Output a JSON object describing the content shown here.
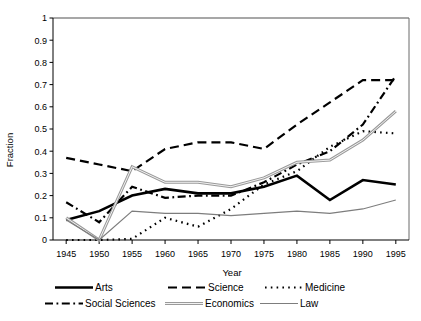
{
  "chart_data": {
    "type": "line",
    "title": "",
    "xlabel": "Year",
    "ylabel": "Fraction",
    "xlim": [
      1943,
      1997
    ],
    "ylim": [
      0,
      1
    ],
    "grid": false,
    "legend_position": "bottom",
    "x": [
      1945,
      1950,
      1955,
      1960,
      1965,
      1970,
      1975,
      1980,
      1985,
      1990,
      1995
    ],
    "xtick_labels": [
      "1945",
      "1950",
      "1955",
      "1960",
      "1965",
      "1970",
      "1975",
      "1980",
      "1985",
      "1990",
      "1995"
    ],
    "ytick_labels": [
      "0",
      "0.1",
      "0.2",
      "0.3",
      "0.4",
      "0.5",
      "0.6",
      "0.7",
      "0.8",
      "0.9",
      "1"
    ],
    "ytick_values": [
      0,
      0.1,
      0.2,
      0.3,
      0.4,
      0.5,
      0.6,
      0.7,
      0.8,
      0.9,
      1
    ],
    "series": [
      {
        "name": "Arts",
        "style": "solid-thick",
        "color": "#000000",
        "width": 2.6,
        "dash": "",
        "values": [
          0.09,
          0.13,
          0.2,
          0.23,
          0.21,
          0.21,
          0.24,
          0.29,
          0.18,
          0.27,
          0.25
        ]
      },
      {
        "name": "Science",
        "style": "dashed",
        "color": "#000000",
        "width": 2.2,
        "dash": "9,5",
        "values": [
          0.37,
          0.34,
          0.31,
          0.41,
          0.44,
          0.44,
          0.41,
          0.52,
          0.62,
          0.72,
          0.72
        ]
      },
      {
        "name": "Medicine",
        "style": "dotted",
        "color": "#000000",
        "width": 2.2,
        "dash": "1.6,4.2",
        "values": [
          0.0,
          0.0,
          0.005,
          0.1,
          0.06,
          0.14,
          0.25,
          0.31,
          0.42,
          0.49,
          0.48
        ]
      },
      {
        "name": "Social Sciences",
        "style": "dash-dot",
        "color": "#000000",
        "width": 2.2,
        "dash": "8,3.5,1.8,3.5",
        "values": [
          0.17,
          0.08,
          0.24,
          0.19,
          0.2,
          0.2,
          0.26,
          0.34,
          0.4,
          0.52,
          0.74
        ]
      },
      {
        "name": "Economics",
        "style": "solid-gray-thick",
        "color": "#9a9a9a",
        "width": 3.0,
        "dash": "",
        "values": [
          0.1,
          0.0,
          0.33,
          0.26,
          0.26,
          0.24,
          0.28,
          0.35,
          0.36,
          0.45,
          0.58
        ]
      },
      {
        "name": "Law",
        "style": "solid-gray-thin",
        "color": "#7d7d7d",
        "width": 1.1,
        "dash": "",
        "values": [
          0.09,
          0.0,
          0.13,
          0.12,
          0.12,
          0.11,
          0.12,
          0.13,
          0.12,
          0.14,
          0.18
        ]
      }
    ]
  },
  "legend": {
    "entries": [
      {
        "label": "Arts"
      },
      {
        "label": "Science"
      },
      {
        "label": "Medicine"
      },
      {
        "label": "Social Sciences"
      },
      {
        "label": "Economics"
      },
      {
        "label": "Law"
      }
    ]
  }
}
